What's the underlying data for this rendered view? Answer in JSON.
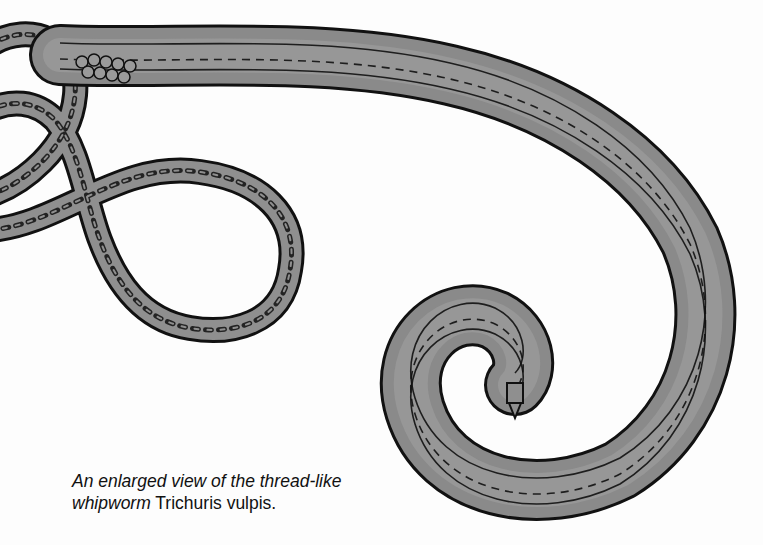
{
  "illustration": {
    "subject": "whipworm",
    "fill_color": "#8f8f8f",
    "outline_color": "#111111"
  },
  "caption": {
    "line1_italic": "An enlarged view of the thread-like",
    "line2_italic": "whipworm",
    "line2_roman": " Trichuris vulpis."
  }
}
